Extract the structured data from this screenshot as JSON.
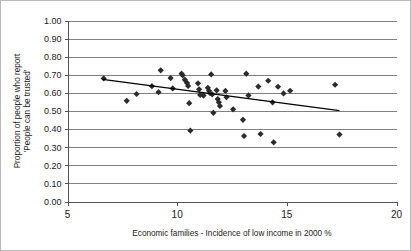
{
  "chart_data": {
    "type": "scatter",
    "title": "",
    "xlabel": "Economic families - Incidence of low income in 2000 %",
    "ylabel": "Proportion of people who report 'People can be trusted'",
    "ylabel_line1": "Proportion of people who report",
    "ylabel_line2": "'People can be trusted'",
    "xlim": [
      5,
      20
    ],
    "ylim": [
      0.0,
      1.0
    ],
    "xticks": [
      5,
      10,
      15,
      20
    ],
    "xtick_labels": [
      "5",
      "10",
      "15",
      "20"
    ],
    "yticks": [
      0.0,
      0.1,
      0.2,
      0.3,
      0.4,
      0.5,
      0.6,
      0.7,
      0.8,
      0.9,
      1.0
    ],
    "ytick_labels": [
      "0.00",
      "0.10",
      "0.20",
      "0.30",
      "0.40",
      "0.50",
      "0.60",
      "0.70",
      "0.80",
      "0.90",
      "1.00"
    ],
    "grid": "horizontal",
    "legend": "none",
    "marker": "diamond",
    "marker_color": "#2b2b2b",
    "gridline_color": "#808080",
    "axis_color": "#555555",
    "trendline": {
      "color": "#000000",
      "x_start": 6.6,
      "y_start": 0.675,
      "x_end": 17.4,
      "y_end": 0.502
    },
    "points": [
      {
        "x": 6.65,
        "y": 0.68
      },
      {
        "x": 7.7,
        "y": 0.556
      },
      {
        "x": 8.15,
        "y": 0.594
      },
      {
        "x": 8.85,
        "y": 0.637
      },
      {
        "x": 9.15,
        "y": 0.604
      },
      {
        "x": 9.25,
        "y": 0.725
      },
      {
        "x": 9.7,
        "y": 0.682
      },
      {
        "x": 9.8,
        "y": 0.625
      },
      {
        "x": 10.2,
        "y": 0.706
      },
      {
        "x": 10.25,
        "y": 0.697
      },
      {
        "x": 10.35,
        "y": 0.672
      },
      {
        "x": 10.45,
        "y": 0.655
      },
      {
        "x": 10.5,
        "y": 0.638
      },
      {
        "x": 10.55,
        "y": 0.543
      },
      {
        "x": 10.6,
        "y": 0.392
      },
      {
        "x": 10.95,
        "y": 0.653
      },
      {
        "x": 11.0,
        "y": 0.62
      },
      {
        "x": 11.05,
        "y": 0.589
      },
      {
        "x": 11.2,
        "y": 0.585
      },
      {
        "x": 11.4,
        "y": 0.628
      },
      {
        "x": 11.45,
        "y": 0.612
      },
      {
        "x": 11.5,
        "y": 0.598
      },
      {
        "x": 11.55,
        "y": 0.702
      },
      {
        "x": 11.6,
        "y": 0.592
      },
      {
        "x": 11.65,
        "y": 0.49
      },
      {
        "x": 11.8,
        "y": 0.614
      },
      {
        "x": 11.85,
        "y": 0.566
      },
      {
        "x": 11.9,
        "y": 0.548
      },
      {
        "x": 11.95,
        "y": 0.528
      },
      {
        "x": 12.2,
        "y": 0.611
      },
      {
        "x": 12.25,
        "y": 0.576
      },
      {
        "x": 12.55,
        "y": 0.509
      },
      {
        "x": 13.0,
        "y": 0.451
      },
      {
        "x": 13.05,
        "y": 0.362
      },
      {
        "x": 13.15,
        "y": 0.706
      },
      {
        "x": 13.25,
        "y": 0.586
      },
      {
        "x": 13.7,
        "y": 0.635
      },
      {
        "x": 13.8,
        "y": 0.373
      },
      {
        "x": 14.15,
        "y": 0.667
      },
      {
        "x": 14.35,
        "y": 0.548
      },
      {
        "x": 14.4,
        "y": 0.327
      },
      {
        "x": 14.6,
        "y": 0.634
      },
      {
        "x": 14.85,
        "y": 0.597
      },
      {
        "x": 15.15,
        "y": 0.612
      },
      {
        "x": 17.2,
        "y": 0.645
      },
      {
        "x": 17.4,
        "y": 0.37
      }
    ]
  }
}
